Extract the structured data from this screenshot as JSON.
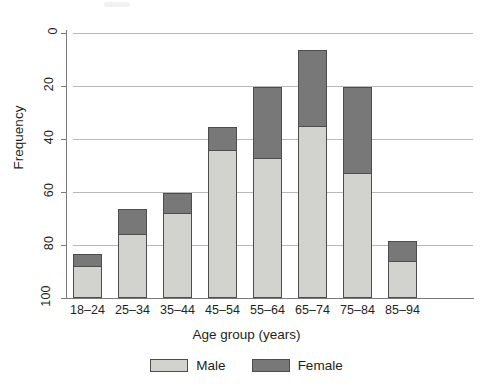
{
  "chart_data": {
    "type": "bar",
    "stacked": true,
    "title": "",
    "xlabel": "Age group (years)",
    "ylabel": "Frequency",
    "categories": [
      "18–24",
      "25–34",
      "35–44",
      "45–54",
      "55–64",
      "65–74",
      "75–84",
      "85–94"
    ],
    "series": [
      {
        "name": "Male",
        "color": "#d2d2cf",
        "values": [
          12,
          24,
          32,
          56,
          53,
          65,
          47,
          14
        ]
      },
      {
        "name": "Female",
        "color": "#787878",
        "values": [
          5,
          10,
          8,
          9,
          27,
          29,
          33,
          8
        ]
      }
    ],
    "totals": [
      17,
      34,
      40,
      65,
      80,
      94,
      80,
      22
    ],
    "ylim": [
      0,
      100
    ],
    "yticks": [
      0,
      20,
      40,
      60,
      80,
      100
    ],
    "ytick_labels": [
      "0",
      "20",
      "40",
      "60",
      "80",
      "100"
    ],
    "grid": "horizontal",
    "legend_position": "bottom"
  },
  "axis": {
    "y_title": "Frequency",
    "x_title": "Age group (years)",
    "y_ticks": [
      {
        "label": "100",
        "value": 100
      },
      {
        "label": "80",
        "value": 80
      },
      {
        "label": "60",
        "value": 60
      },
      {
        "label": "40",
        "value": 40
      },
      {
        "label": "20",
        "value": 20
      },
      {
        "label": "0",
        "value": 0
      }
    ],
    "x_ticks": [
      {
        "label": "18–24"
      },
      {
        "label": "25–34"
      },
      {
        "label": "35–44"
      },
      {
        "label": "45–54"
      },
      {
        "label": "55–64"
      },
      {
        "label": "65–74"
      },
      {
        "label": "75–84"
      },
      {
        "label": "85–94"
      }
    ]
  },
  "legend": {
    "items": [
      {
        "label": "Male",
        "color": "#d2d2cf"
      },
      {
        "label": "Female",
        "color": "#787878"
      }
    ]
  },
  "colors": {
    "male": "#d2d2cf",
    "female": "#787878",
    "grid": "#b9b9b9",
    "axis": "#7a7a7a",
    "bar_border": "#4d4d4d",
    "text": "#231f20",
    "background": "#ffffff"
  }
}
